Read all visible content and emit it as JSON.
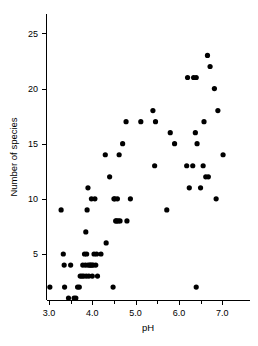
{
  "chart_data": {
    "type": "scatter",
    "title": "",
    "xlabel": "pH",
    "ylabel": "Number of species",
    "xlim": [
      3.0,
      7.35
    ],
    "ylim": [
      0.5,
      26.5
    ],
    "xticks": [
      3.0,
      4.0,
      5.0,
      6.0,
      7.0
    ],
    "xtick_labels": [
      "3.0",
      "4.0",
      "5.0",
      "6.0",
      "7.0"
    ],
    "xticks_minor": [
      3.5,
      4.5,
      5.5,
      6.5
    ],
    "yticks": [
      5,
      10,
      15,
      20,
      25
    ],
    "ytick_labels": [
      "5",
      "10",
      "15",
      "20",
      "25"
    ],
    "grid": false,
    "legend": null,
    "marker": "filled-circle",
    "marker_color": "#000000",
    "marker_size_px": 2.6,
    "n_points": 99,
    "points": [
      [
        3.02,
        2
      ],
      [
        3.28,
        9
      ],
      [
        3.33,
        5
      ],
      [
        3.35,
        4
      ],
      [
        3.36,
        2
      ],
      [
        3.45,
        1
      ],
      [
        3.5,
        4
      ],
      [
        3.58,
        1
      ],
      [
        3.62,
        1
      ],
      [
        3.66,
        2
      ],
      [
        3.7,
        2
      ],
      [
        3.72,
        3
      ],
      [
        3.76,
        3
      ],
      [
        3.78,
        4
      ],
      [
        3.8,
        3
      ],
      [
        3.82,
        5
      ],
      [
        3.84,
        4
      ],
      [
        3.85,
        7
      ],
      [
        3.86,
        3
      ],
      [
        3.87,
        5
      ],
      [
        3.88,
        9
      ],
      [
        3.9,
        11
      ],
      [
        3.9,
        4
      ],
      [
        3.92,
        3
      ],
      [
        3.94,
        4
      ],
      [
        3.96,
        4
      ],
      [
        3.98,
        10
      ],
      [
        3.99,
        4
      ],
      [
        4.0,
        3
      ],
      [
        4.02,
        4
      ],
      [
        4.04,
        5
      ],
      [
        4.06,
        10
      ],
      [
        4.08,
        4
      ],
      [
        4.1,
        5
      ],
      [
        4.12,
        3
      ],
      [
        4.2,
        5
      ],
      [
        4.3,
        14
      ],
      [
        4.32,
        6
      ],
      [
        4.4,
        12
      ],
      [
        4.48,
        2
      ],
      [
        4.5,
        10
      ],
      [
        4.52,
        10
      ],
      [
        4.54,
        8
      ],
      [
        4.56,
        8
      ],
      [
        4.58,
        10
      ],
      [
        4.6,
        8
      ],
      [
        4.62,
        14
      ],
      [
        4.64,
        8
      ],
      [
        4.7,
        15
      ],
      [
        4.78,
        17
      ],
      [
        4.8,
        8
      ],
      [
        4.88,
        10
      ],
      [
        5.12,
        17
      ],
      [
        5.4,
        18
      ],
      [
        5.44,
        13
      ],
      [
        5.46,
        17
      ],
      [
        5.72,
        9
      ],
      [
        5.8,
        16
      ],
      [
        5.9,
        15
      ],
      [
        6.18,
        13
      ],
      [
        6.2,
        21
      ],
      [
        6.24,
        11
      ],
      [
        6.32,
        13
      ],
      [
        6.34,
        21
      ],
      [
        6.38,
        16
      ],
      [
        6.4,
        21
      ],
      [
        6.4,
        2
      ],
      [
        6.42,
        15
      ],
      [
        6.5,
        11
      ],
      [
        6.56,
        13
      ],
      [
        6.58,
        17
      ],
      [
        6.62,
        12
      ],
      [
        6.66,
        23
      ],
      [
        6.68,
        12
      ],
      [
        6.72,
        22
      ],
      [
        6.82,
        20
      ],
      [
        6.86,
        10
      ],
      [
        6.9,
        18
      ],
      [
        7.02,
        14
      ]
    ]
  },
  "axes": {
    "x_axis_label": "pH",
    "y_axis_label": "Number of species"
  }
}
